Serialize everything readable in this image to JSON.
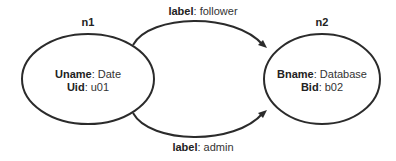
{
  "diagram": {
    "type": "graph",
    "nodes": [
      {
        "id": "n1",
        "label": "n1",
        "properties": [
          {
            "key": "Uname",
            "sep": ": ",
            "value": "Date"
          },
          {
            "key": "Uid",
            "sep": ": ",
            "value": "u01"
          }
        ]
      },
      {
        "id": "n2",
        "label": "n2",
        "properties": [
          {
            "key": "Bname",
            "sep": ": ",
            "value": "Database"
          },
          {
            "key": "Bid",
            "sep": ": ",
            "value": "b02"
          }
        ]
      }
    ],
    "edges": [
      {
        "from": "n1",
        "to": "n2",
        "key": "label",
        "sep": ": ",
        "value": "follower"
      },
      {
        "from": "n1",
        "to": "n2",
        "key": "label",
        "sep": ": ",
        "value": "admin"
      }
    ],
    "colors": {
      "stroke": "#2b2b2b",
      "text": "#333333",
      "background": "#ffffff"
    }
  }
}
